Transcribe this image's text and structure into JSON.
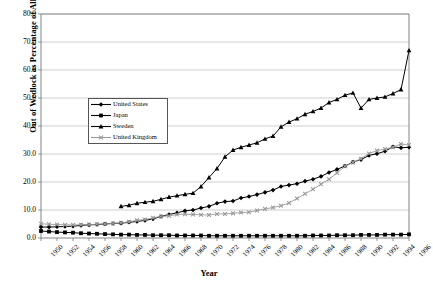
{
  "chart_data": {
    "type": "line",
    "title": "",
    "xlabel": "Year",
    "ylabel": "Out of Wedlock as Percentage of All Births",
    "ylim": [
      0.0,
      80.0
    ],
    "ytick_labels": [
      "0.0",
      "10.0",
      "20.0",
      "30.0",
      "40.0",
      "50.0",
      "60.0",
      "70.0",
      "80.0"
    ],
    "ytick_values": [
      0,
      10,
      20,
      30,
      40,
      50,
      60,
      70,
      80
    ],
    "xlim": [
      1950,
      1996
    ],
    "xtick_labels": [
      "1950",
      "1952",
      "1954",
      "1956",
      "1958",
      "1960",
      "1962",
      "1964",
      "1966",
      "1968",
      "1970",
      "1972",
      "1974",
      "1976",
      "1978",
      "1980",
      "1982",
      "1984",
      "1986",
      "1988",
      "1990",
      "1992",
      "1994",
      "1996"
    ],
    "xtick_values": [
      1950,
      1952,
      1954,
      1956,
      1958,
      1960,
      1962,
      1964,
      1966,
      1968,
      1970,
      1972,
      1974,
      1976,
      1978,
      1980,
      1982,
      1984,
      1986,
      1988,
      1990,
      1992,
      1994,
      1996
    ],
    "grid": "horizontal",
    "legend_position": "upper-left-inside",
    "series": [
      {
        "name": "United States",
        "color": "#000000",
        "marker": "diamond",
        "x": [
          1950,
          1951,
          1952,
          1953,
          1954,
          1955,
          1956,
          1957,
          1958,
          1959,
          1960,
          1961,
          1962,
          1963,
          1964,
          1965,
          1966,
          1967,
          1968,
          1969,
          1970,
          1971,
          1972,
          1973,
          1974,
          1975,
          1976,
          1977,
          1978,
          1979,
          1980,
          1981,
          1982,
          1983,
          1984,
          1985,
          1986,
          1987,
          1988,
          1989,
          1990,
          1991,
          1992,
          1993,
          1994,
          1995,
          1996
        ],
        "values": [
          3.9,
          3.9,
          4.0,
          4.1,
          4.2,
          4.5,
          4.7,
          4.8,
          5.0,
          5.2,
          5.3,
          5.6,
          5.9,
          6.3,
          6.8,
          7.7,
          8.4,
          9.0,
          9.7,
          10.0,
          10.7,
          11.3,
          12.4,
          13.0,
          13.2,
          14.3,
          14.8,
          15.5,
          16.3,
          17.1,
          18.4,
          18.9,
          19.4,
          20.3,
          21.0,
          22.0,
          23.4,
          24.5,
          25.7,
          27.1,
          28.0,
          29.5,
          30.1,
          31.0,
          32.6,
          32.2,
          32.4
        ]
      },
      {
        "name": "Japan",
        "color": "#000000",
        "marker": "square",
        "x": [
          1950,
          1951,
          1952,
          1953,
          1954,
          1955,
          1956,
          1957,
          1958,
          1959,
          1960,
          1961,
          1962,
          1963,
          1964,
          1965,
          1966,
          1967,
          1968,
          1969,
          1970,
          1971,
          1972,
          1973,
          1974,
          1975,
          1976,
          1977,
          1978,
          1979,
          1980,
          1981,
          1982,
          1983,
          1984,
          1985,
          1986,
          1987,
          1988,
          1989,
          1990,
          1991,
          1992,
          1993,
          1994,
          1995,
          1996
        ],
        "values": [
          2.5,
          2.3,
          2.1,
          2.0,
          1.9,
          1.7,
          1.6,
          1.5,
          1.4,
          1.3,
          1.2,
          1.2,
          1.1,
          1.1,
          1.0,
          1.0,
          1.0,
          0.9,
          0.9,
          0.9,
          0.9,
          0.8,
          0.8,
          0.8,
          0.8,
          0.8,
          0.8,
          0.8,
          0.8,
          0.8,
          0.8,
          0.8,
          0.8,
          0.8,
          0.9,
          0.9,
          0.9,
          1.0,
          1.0,
          1.0,
          1.1,
          1.1,
          1.1,
          1.2,
          1.2,
          1.2,
          1.3
        ]
      },
      {
        "name": "Sweden",
        "color": "#000000",
        "marker": "triangle",
        "x": [
          1960,
          1961,
          1962,
          1963,
          1964,
          1965,
          1966,
          1967,
          1968,
          1969,
          1970,
          1971,
          1972,
          1973,
          1974,
          1975,
          1976,
          1977,
          1978,
          1979,
          1980,
          1981,
          1982,
          1983,
          1984,
          1985,
          1986,
          1987,
          1988,
          1989,
          1990,
          1991,
          1992,
          1993,
          1994,
          1995,
          1996
        ],
        "values": [
          11.3,
          11.7,
          12.4,
          12.8,
          13.1,
          13.8,
          14.6,
          15.1,
          15.6,
          16.0,
          18.4,
          21.6,
          24.8,
          29.0,
          31.4,
          32.4,
          33.2,
          34.0,
          35.4,
          36.4,
          39.7,
          41.4,
          42.6,
          44.2,
          45.2,
          46.4,
          48.4,
          49.5,
          51.0,
          51.8,
          46.4,
          49.5,
          50.0,
          50.4,
          51.6,
          53.0,
          67.0
        ]
      },
      {
        "name": "United Kingdom",
        "color": "#9a9a9a",
        "marker": "cross",
        "x": [
          1950,
          1951,
          1952,
          1953,
          1954,
          1955,
          1956,
          1957,
          1958,
          1959,
          1960,
          1961,
          1962,
          1963,
          1964,
          1965,
          1966,
          1967,
          1968,
          1969,
          1970,
          1971,
          1972,
          1973,
          1974,
          1975,
          1976,
          1977,
          1978,
          1979,
          1980,
          1981,
          1982,
          1983,
          1984,
          1985,
          1986,
          1987,
          1988,
          1989,
          1990,
          1991,
          1992,
          1993,
          1994,
          1995,
          1996
        ],
        "values": [
          5.1,
          4.9,
          4.8,
          4.7,
          4.7,
          4.7,
          4.8,
          4.9,
          5.0,
          5.2,
          5.4,
          5.8,
          6.3,
          6.6,
          7.2,
          7.7,
          7.9,
          8.4,
          8.5,
          8.4,
          8.3,
          8.2,
          8.6,
          8.6,
          8.8,
          9.1,
          9.2,
          9.8,
          10.4,
          10.9,
          11.5,
          12.5,
          14.1,
          15.8,
          17.4,
          19.2,
          21.0,
          23.2,
          25.6,
          27.0,
          28.3,
          30.2,
          31.2,
          31.8,
          32.4,
          33.6,
          33.2
        ]
      }
    ]
  }
}
